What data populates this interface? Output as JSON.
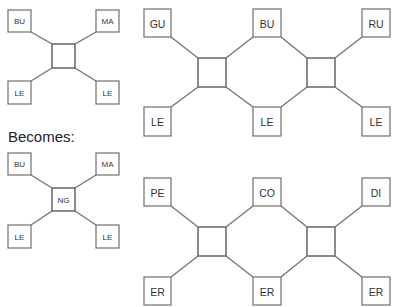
{
  "caption": {
    "becomes_label": "Becomes:"
  },
  "colors": {
    "stroke": "#6e6e6e",
    "text": "#333333",
    "background": "#ffffff"
  },
  "diagrams": {
    "before_small": {
      "top_left": "BU",
      "top_right": "MA",
      "bottom_left": "LE",
      "bottom_right": "LE",
      "center": ""
    },
    "before_large": {
      "top_left": "GU",
      "top_middle": "BU",
      "top_right": "RU",
      "bottom_left": "LE",
      "bottom_middle": "LE",
      "bottom_right": "LE",
      "center_left": "",
      "center_right": ""
    },
    "after_small": {
      "top_left": "BU",
      "top_right": "MA",
      "bottom_left": "LE",
      "bottom_right": "LE",
      "center": "NG"
    },
    "after_large": {
      "top_left": "PE",
      "top_middle": "CO",
      "top_right": "DI",
      "bottom_left": "ER",
      "bottom_middle": "ER",
      "bottom_right": "ER",
      "center_left": "",
      "center_right": ""
    }
  }
}
